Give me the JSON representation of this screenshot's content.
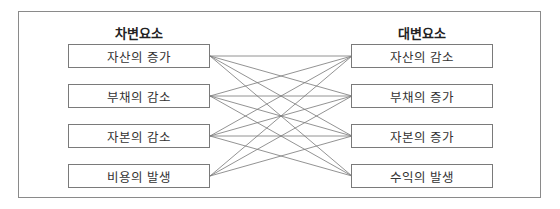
{
  "diagram": {
    "debit": {
      "title": "차변요소",
      "items": [
        "자산의 증가",
        "부채의 감소",
        "자본의 감소",
        "비용의 발생"
      ]
    },
    "credit": {
      "title": "대변요소",
      "items": [
        "자산의 감소",
        "부채의 증가",
        "자본의 증가",
        "수익의 발생"
      ]
    },
    "connections": [
      [
        0,
        0
      ],
      [
        0,
        1
      ],
      [
        0,
        2
      ],
      [
        0,
        3
      ],
      [
        1,
        0
      ],
      [
        1,
        1
      ],
      [
        1,
        2
      ],
      [
        1,
        3
      ],
      [
        2,
        0
      ],
      [
        2,
        1
      ],
      [
        2,
        2
      ],
      [
        2,
        3
      ],
      [
        3,
        0
      ],
      [
        3,
        1
      ],
      [
        3,
        2
      ]
    ],
    "colors": {
      "border": "#7a7a7a",
      "line": "#777777",
      "text": "#333333"
    }
  }
}
